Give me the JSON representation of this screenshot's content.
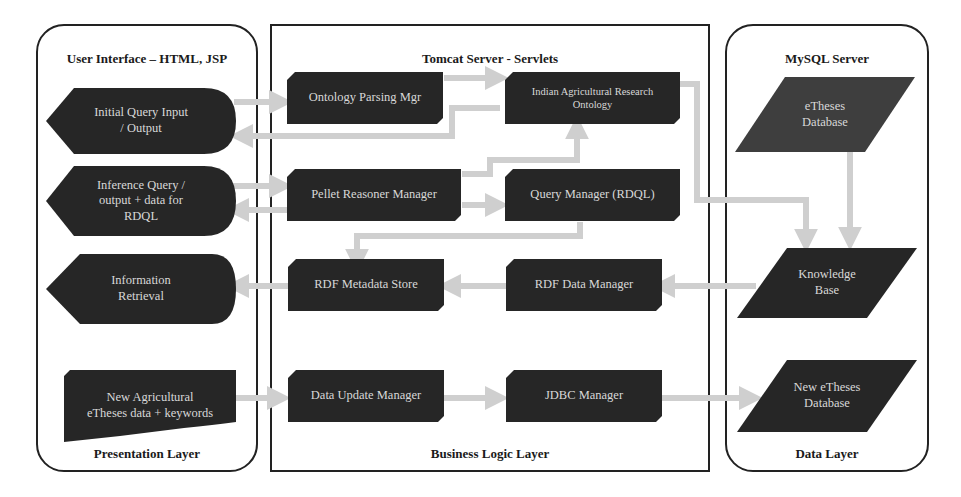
{
  "colors": {
    "node_fill": "#262626",
    "db_fill_light": "#3e3e3e",
    "node_text": "#d8d8d8",
    "arrow": "#cfcfcf",
    "border": "#222222"
  },
  "layers": {
    "presentation": {
      "title": "User Interface – HTML, JSP",
      "footer": "Presentation Layer",
      "nodes": [
        {
          "id": "initial_query",
          "label": "Initial Query Input\n/ Output",
          "shape": "display"
        },
        {
          "id": "inference_query",
          "label": "Inference  Query /\noutput + data for\nRDQL",
          "shape": "display"
        },
        {
          "id": "information_retrieval",
          "label": "Information\nRetrieval",
          "shape": "display"
        },
        {
          "id": "new_agri_data",
          "label": "New Agricultural\neTheses data + keywords",
          "shape": "manual-input"
        }
      ]
    },
    "business": {
      "title": "Tomcat Server - Servlets",
      "footer": "Business Logic Layer",
      "nodes": [
        {
          "id": "ontology_parsing",
          "label": "Ontology Parsing Mgr",
          "shape": "snipped-rect"
        },
        {
          "id": "iar_ontology",
          "label": "Indian Agricultural Research\nOntology",
          "shape": "snipped-rect"
        },
        {
          "id": "pellet_reasoner",
          "label": "Pellet Reasoner Manager",
          "shape": "snipped-rect"
        },
        {
          "id": "query_manager",
          "label": "Query Manager (RDQL)",
          "shape": "snipped-rect"
        },
        {
          "id": "rdf_metadata_store",
          "label": "RDF Metadata Store",
          "shape": "snipped-rect"
        },
        {
          "id": "rdf_data_manager",
          "label": "RDF Data Manager",
          "shape": "snipped-rect"
        },
        {
          "id": "data_update_manager",
          "label": "Data Update Manager",
          "shape": "snipped-rect"
        },
        {
          "id": "jdbc_manager",
          "label": "JDBC Manager",
          "shape": "snipped-rect"
        }
      ]
    },
    "data": {
      "title": "MySQL Server",
      "footer": "Data Layer",
      "nodes": [
        {
          "id": "etheses_db",
          "label": "eTheses\nDatabase",
          "shape": "parallelogram"
        },
        {
          "id": "knowledge_base",
          "label": "Knowledge\nBase",
          "shape": "parallelogram"
        },
        {
          "id": "new_etheses_db",
          "label": "New eTheses\nDatabase",
          "shape": "parallelogram"
        }
      ]
    }
  },
  "edges": [
    {
      "from": "initial_query",
      "to": "ontology_parsing"
    },
    {
      "from": "iar_ontology",
      "to": "initial_query"
    },
    {
      "from": "ontology_parsing",
      "to": "iar_ontology"
    },
    {
      "from": "inference_query",
      "to": "pellet_reasoner"
    },
    {
      "from": "pellet_reasoner",
      "to": "inference_query"
    },
    {
      "from": "pellet_reasoner",
      "to": "iar_ontology"
    },
    {
      "from": "pellet_reasoner",
      "to": "query_manager"
    },
    {
      "from": "query_manager",
      "to": "rdf_metadata_store"
    },
    {
      "from": "iar_ontology",
      "to": "knowledge_base"
    },
    {
      "from": "etheses_db",
      "to": "knowledge_base"
    },
    {
      "from": "knowledge_base",
      "to": "rdf_data_manager"
    },
    {
      "from": "rdf_data_manager",
      "to": "rdf_metadata_store"
    },
    {
      "from": "rdf_metadata_store",
      "to": "information_retrieval"
    },
    {
      "from": "new_agri_data",
      "to": "data_update_manager"
    },
    {
      "from": "data_update_manager",
      "to": "jdbc_manager"
    },
    {
      "from": "jdbc_manager",
      "to": "new_etheses_db"
    }
  ]
}
